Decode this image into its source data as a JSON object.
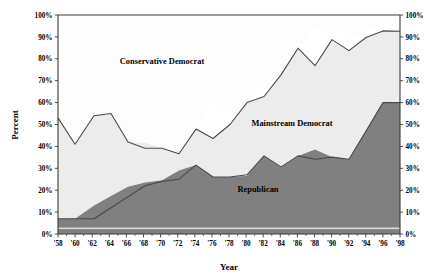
{
  "chart_data": {
    "type": "area",
    "title": "",
    "xlabel": "Year",
    "ylabel": "Percent",
    "ylim": [
      0,
      100
    ],
    "grid": false,
    "legend_position": "inline-annotations",
    "stacked": true,
    "x": [
      1958,
      1960,
      1962,
      1964,
      1966,
      1968,
      1970,
      1972,
      1974,
      1976,
      1978,
      1980,
      1982,
      1984,
      1986,
      1988,
      1990,
      1992,
      1994,
      1996,
      1998
    ],
    "x_tick_labels": [
      "'58",
      "'60",
      "'62",
      "'64",
      "'66",
      "'68",
      "'70",
      "'72",
      "'74",
      "'76",
      "'78",
      "'80",
      "'82",
      "'84",
      "'86",
      "'88",
      "'90",
      "'92",
      "'94",
      "'96",
      "'98"
    ],
    "y_tick_labels": [
      "0%",
      "10%",
      "20%",
      "30%",
      "40%",
      "50%",
      "60%",
      "70%",
      "80%",
      "90%",
      "100%"
    ],
    "y_tick_values": [
      0,
      10,
      20,
      30,
      40,
      50,
      60,
      70,
      80,
      90,
      100
    ],
    "right_axis_tick_labels": [
      "0%",
      "10%",
      "20%",
      "30%",
      "40%",
      "50%",
      "60%",
      "70%",
      "80%",
      "90%",
      "100%"
    ],
    "series": [
      {
        "name": "Republican",
        "label": "Republican",
        "color": "#7f7f7f",
        "values": [
          7,
          7,
          7,
          12,
          17,
          22,
          24,
          25,
          31,
          26,
          26,
          27,
          35,
          31,
          36,
          34,
          35,
          34,
          47,
          60,
          60
        ]
      },
      {
        "name": "Mainstream Democrat",
        "label": "Mainstream Democrat",
        "color": "#ececec",
        "values": [
          46,
          34,
          47,
          43,
          25,
          16,
          15,
          12,
          17,
          19,
          24,
          33,
          28,
          42,
          49,
          43,
          54,
          50,
          43,
          33,
          33
        ]
      },
      {
        "name": "Conservative Democrat",
        "label": "Conservative Democrat",
        "color": "#ffffff",
        "values": [
          47,
          59,
          46,
          45,
          58,
          62,
          61,
          63,
          52,
          55,
          50,
          40,
          37,
          27,
          15,
          23,
          11,
          16,
          10,
          7,
          7
        ]
      }
    ],
    "cumulative_upper_boundary": [
      53,
      41,
      54,
      55,
      42,
      38,
      39,
      37,
      48,
      45,
      50,
      60,
      63,
      73,
      85,
      77,
      89,
      84,
      90,
      93,
      93
    ],
    "annotations": [
      {
        "text": "Conservative Democrat",
        "x": 1964,
        "y": 80
      },
      {
        "text": "Mainstream Democrat",
        "x": 1986,
        "y": 47
      },
      {
        "text": "Republican",
        "x": 1985,
        "y": 19
      }
    ]
  }
}
